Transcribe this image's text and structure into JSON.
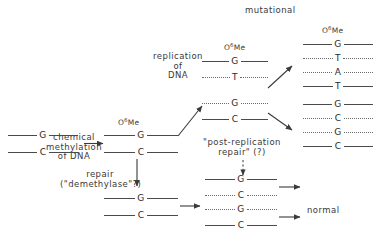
{
  "diagram": {
    "title_implicit": "O6-methylguanine DNA damage, repair and mutagenesis pathway",
    "labels": {
      "chemical_methylation": "chemical\nmethylation\nof DNA",
      "replication_of_dna": "replication\nof\nDNA",
      "repair_demethylase": "repair\n(\"demethylase\"?)",
      "post_replication_repair": "\"post-replication\nrepair\" (?)",
      "mutational": "mutational",
      "normal": "normal",
      "methyl_tag": "Me",
      "methyl_tag_full": "O6Me",
      "methyl_oxygen": "O",
      "methyl_superscript": "6"
    },
    "bases": {
      "G": "G",
      "C": "C",
      "T": "T",
      "A": "A"
    },
    "duplexes": [
      {
        "name": "unmodified-dna",
        "methylated": false,
        "strands": [
          {
            "base": "G",
            "style": "solid"
          },
          {
            "base": "C",
            "style": "solid"
          }
        ]
      },
      {
        "name": "methylated-dna",
        "methylated": true,
        "strands": [
          {
            "base": "G",
            "style": "solid"
          },
          {
            "base": "C",
            "style": "solid"
          }
        ]
      },
      {
        "name": "repaired-dna",
        "methylated": false,
        "strands": [
          {
            "base": "G",
            "style": "solid"
          },
          {
            "base": "C",
            "style": "solid"
          }
        ]
      },
      {
        "name": "replicated-methylated-top",
        "methylated": true,
        "strands": [
          {
            "base": "G",
            "style": "solid"
          },
          {
            "base": "T",
            "style": "dotted"
          }
        ]
      },
      {
        "name": "replicated-methylated-bottom",
        "methylated": false,
        "strands": [
          {
            "base": "G",
            "style": "dotted"
          },
          {
            "base": "C",
            "style": "solid"
          }
        ]
      },
      {
        "name": "post-replication-repair-top",
        "methylated": false,
        "strands": [
          {
            "base": "G",
            "style": "solid"
          },
          {
            "base": "C",
            "style": "dotted"
          }
        ]
      },
      {
        "name": "post-replication-repair-bottom",
        "methylated": false,
        "strands": [
          {
            "base": "G",
            "style": "dotted"
          },
          {
            "base": "C",
            "style": "solid"
          }
        ]
      },
      {
        "name": "mutational-outcome-top",
        "methylated": true,
        "strands": [
          {
            "base": "G",
            "style": "solid"
          },
          {
            "base": "T",
            "style": "dotted"
          }
        ]
      },
      {
        "name": "mutational-outcome-bottom",
        "methylated": false,
        "strands": [
          {
            "base": "A",
            "style": "dotted"
          },
          {
            "base": "T",
            "style": "solid"
          }
        ]
      },
      {
        "name": "normal-outcome-top",
        "methylated": false,
        "strands": [
          {
            "base": "G",
            "style": "solid"
          },
          {
            "base": "C",
            "style": "dotted"
          }
        ]
      },
      {
        "name": "normal-outcome-bottom",
        "methylated": false,
        "strands": [
          {
            "base": "G",
            "style": "dotted"
          },
          {
            "base": "C",
            "style": "solid"
          }
        ]
      }
    ],
    "colors": {
      "ink": "#2b2b2b",
      "line": "#4a4a4a",
      "dotted_line": "#6a6a6a",
      "background": "#ffffff"
    }
  }
}
